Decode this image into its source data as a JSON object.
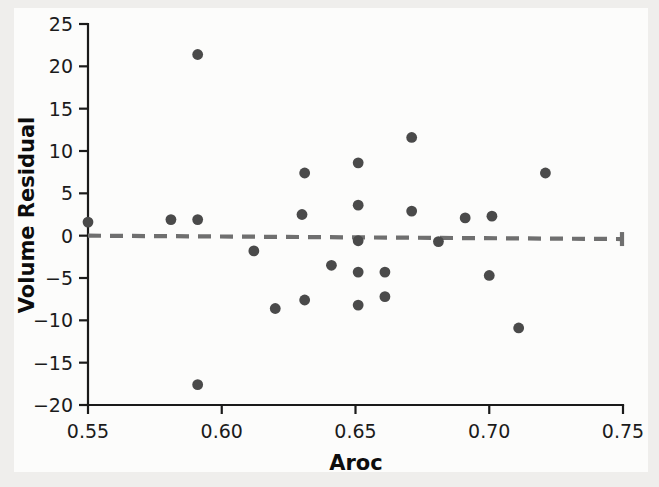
{
  "figure": {
    "background_color": "#efeeec",
    "paper_color": "#fcfcfb",
    "point_color": "#4a4a4a",
    "axis_color": "#1a1a1a",
    "reference_line_color": "#6f6f6f"
  },
  "chart_data": {
    "type": "scatter",
    "title": "",
    "xlabel": "Aroc",
    "ylabel": "Volume Residual",
    "xlim": [
      0.55,
      0.75
    ],
    "ylim": [
      -20,
      25
    ],
    "grid": false,
    "legend": null,
    "xticks": [
      0.55,
      0.6,
      0.65,
      0.7,
      0.75
    ],
    "xtick_labels": [
      "0.55",
      "0.60",
      "0.65",
      "0.70",
      "0.75"
    ],
    "yticks": [
      25,
      20,
      15,
      10,
      5,
      0,
      -5,
      -10,
      -15,
      -20
    ],
    "ytick_labels": [
      "25",
      "20",
      "15",
      "10",
      "5",
      "0",
      "−5",
      "−10",
      "−15",
      "−20"
    ],
    "annotations": [
      {
        "type": "reference-line",
        "style": "dashed",
        "label": "zero residual line",
        "x": [
          0.55,
          0.75
        ],
        "y": [
          0.0,
          -0.4
        ]
      }
    ],
    "x": [
      0.55,
      0.581,
      0.591,
      0.591,
      0.591,
      0.612,
      0.62,
      0.63,
      0.631,
      0.631,
      0.641,
      0.651,
      0.651,
      0.651,
      0.651,
      0.651,
      0.661,
      0.661,
      0.671,
      0.671,
      0.681,
      0.691,
      0.7,
      0.701,
      0.711,
      0.721
    ],
    "y": [
      1.6,
      1.9,
      21.4,
      1.9,
      -17.6,
      -1.8,
      -8.6,
      2.5,
      7.4,
      -7.6,
      -3.5,
      8.6,
      3.6,
      -0.6,
      -4.3,
      -8.2,
      -4.3,
      -7.2,
      11.6,
      2.9,
      -0.7,
      2.1,
      -4.7,
      2.3,
      -10.9,
      7.4
    ]
  }
}
